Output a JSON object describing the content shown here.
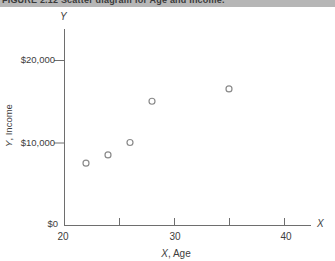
{
  "caption": {
    "text": "FIGURE 2.12  Scatter diagram for Age and Income."
  },
  "colors": {
    "background": "#ffffff",
    "caption_band_bg": "#b6b6b6",
    "caption_text": "#3a3a3a",
    "axis": "#6e6e6e",
    "label_text": "#3d3d3d",
    "point_stroke": "#8a8a8a",
    "point_fill": "#ffffff"
  },
  "chart_data": {
    "type": "scatter",
    "title": "Scatter diagram for Age and Income",
    "xlabel": "X, Age",
    "ylabel": "Y, Income",
    "xlabel_letter": "X",
    "xlabel_rest": ", Age",
    "ylabel_letter": "Y",
    "ylabel_rest": ", Income",
    "x_axis_end_letter": "X",
    "y_axis_end_letter": "Y",
    "origin_label": "$0",
    "x": [
      22,
      24,
      26,
      28,
      35
    ],
    "y": [
      7500,
      8500,
      10000,
      15000,
      16500
    ],
    "xlim": [
      20,
      42.5
    ],
    "ylim": [
      0,
      23500
    ],
    "x_tick_labels": [
      "20",
      "30",
      "40"
    ],
    "x_tick_values_labeled": [
      20,
      30,
      40
    ],
    "x_tick_values_marked": [
      25,
      30,
      35,
      40
    ],
    "y_tick_labels": [
      "$10,000",
      "$20,000"
    ],
    "y_tick_values": [
      10000,
      20000
    ],
    "grid": false,
    "legend": "none",
    "marker": "open-circle"
  }
}
